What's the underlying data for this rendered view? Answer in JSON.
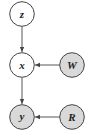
{
  "diagram": {
    "type": "graphical-model",
    "colors": {
      "observed_fill": "#d9d9d9",
      "latent_fill": "#ffffff",
      "stroke": "#444444",
      "edge": "#444444"
    },
    "nodes": [
      {
        "id": "z",
        "label": "z",
        "observed": false,
        "cx": 22,
        "cy": 14
      },
      {
        "id": "x",
        "label": "x",
        "observed": false,
        "cx": 22,
        "cy": 65
      },
      {
        "id": "W",
        "label": "W",
        "observed": true,
        "cx": 72,
        "cy": 65
      },
      {
        "id": "y",
        "label": "y",
        "observed": true,
        "cx": 22,
        "cy": 117
      },
      {
        "id": "R",
        "label": "R",
        "observed": true,
        "cx": 72,
        "cy": 117
      }
    ],
    "edges": [
      {
        "from": "z",
        "to": "x"
      },
      {
        "from": "W",
        "to": "x"
      },
      {
        "from": "x",
        "to": "y"
      },
      {
        "from": "R",
        "to": "y"
      }
    ]
  }
}
